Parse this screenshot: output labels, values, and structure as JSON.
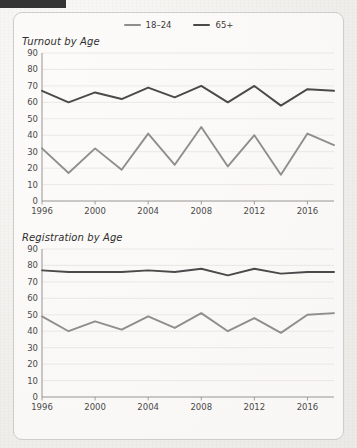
{
  "redaction": {
    "present": true,
    "color": "#343434"
  },
  "legend": {
    "position": "top-center",
    "items": [
      {
        "label": "18–24",
        "color": "#8e8e8e",
        "icon": "line-swatch"
      },
      {
        "label": "65+",
        "color": "#4a4a4a",
        "icon": "line-swatch"
      }
    ]
  },
  "chart_data": [
    {
      "type": "line",
      "title": "Turnout by Age",
      "xlabel": "",
      "ylabel": "",
      "grid": true,
      "legend_position": "top-center",
      "x": [
        1996,
        1998,
        2000,
        2002,
        2004,
        2006,
        2008,
        2010,
        2012,
        2014,
        2016,
        2018
      ],
      "tick_labels_x": [
        "1996",
        "2000",
        "2004",
        "2008",
        "2012",
        "2016"
      ],
      "tick_values_x": [
        1996,
        2000,
        2004,
        2008,
        2012,
        2016
      ],
      "tick_labels_y": [
        "0",
        "10",
        "20",
        "30",
        "40",
        "50",
        "60",
        "70",
        "80",
        "90"
      ],
      "ylim": [
        0,
        90
      ],
      "xlim": [
        1996,
        2018
      ],
      "series": [
        {
          "name": "18–24",
          "color": "#8e8e8e",
          "values": [
            32,
            17,
            32,
            19,
            41,
            22,
            45,
            21,
            40,
            16,
            41,
            34
          ]
        },
        {
          "name": "65+",
          "color": "#4a4a4a",
          "values": [
            67,
            60,
            66,
            62,
            69,
            63,
            70,
            60,
            70,
            58,
            68,
            67
          ]
        }
      ]
    },
    {
      "type": "line",
      "title": "Registration by Age",
      "xlabel": "",
      "ylabel": "",
      "grid": true,
      "legend_position": "top-center",
      "x": [
        1996,
        1998,
        2000,
        2002,
        2004,
        2006,
        2008,
        2010,
        2012,
        2014,
        2016,
        2018
      ],
      "tick_labels_x": [
        "1996",
        "2000",
        "2004",
        "2008",
        "2012",
        "2016"
      ],
      "tick_values_x": [
        1996,
        2000,
        2004,
        2008,
        2012,
        2016
      ],
      "tick_labels_y": [
        "0",
        "10",
        "20",
        "30",
        "40",
        "50",
        "60",
        "70",
        "80",
        "90"
      ],
      "ylim": [
        0,
        90
      ],
      "xlim": [
        1996,
        2018
      ],
      "series": [
        {
          "name": "18–24",
          "color": "#8e8e8e",
          "values": [
            49,
            40,
            46,
            41,
            49,
            42,
            51,
            40,
            48,
            39,
            50,
            51
          ]
        },
        {
          "name": "65+",
          "color": "#4a4a4a",
          "values": [
            77,
            76,
            76,
            76,
            77,
            76,
            78,
            74,
            78,
            75,
            76,
            76
          ]
        }
      ]
    }
  ]
}
